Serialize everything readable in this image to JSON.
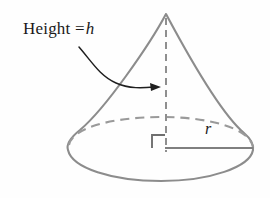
{
  "figure": {
    "background_color": "#fefefe",
    "shape_stroke_color": "#8c8c8c",
    "annotation_color": "#1a1a1a",
    "dashed_stroke_color": "#9a9a9a",
    "labels": {
      "height": {
        "prefix": "Height =",
        "variable": "h",
        "full_text": "Height = h"
      },
      "radius": {
        "variable": "r"
      }
    },
    "geometry": {
      "apex": [
        166,
        13
      ],
      "base_center": [
        166,
        148
      ],
      "base_radius_x": 87,
      "base_radius_y": 32,
      "left_base_point": [
        68,
        142
      ],
      "right_base_point": [
        253,
        147
      ],
      "height_axis_top": [
        166,
        18
      ],
      "height_axis_bottom": [
        166,
        152
      ],
      "radius_line_start": [
        166,
        148
      ],
      "radius_line_end": [
        253,
        148
      ],
      "right_angle_marker_size": 12,
      "arrow_start": [
        79,
        47
      ],
      "arrow_tip": [
        161,
        87
      ]
    }
  }
}
